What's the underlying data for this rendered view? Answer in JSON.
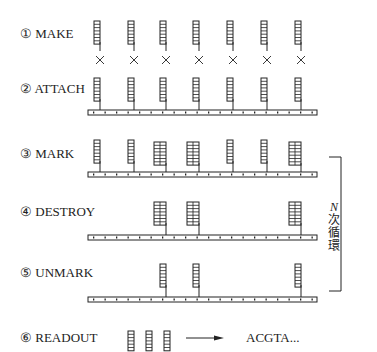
{
  "steps": [
    {
      "num": "①",
      "name": "MAKE",
      "label": "① MAKE"
    },
    {
      "num": "②",
      "name": "ATTACH",
      "label": "② ATTACH"
    },
    {
      "num": "③",
      "name": "MARK",
      "label": "③ MARK"
    },
    {
      "num": "④",
      "name": "DESTROY",
      "label": "④ DESTROY"
    },
    {
      "num": "⑤",
      "name": "UNMARK",
      "label": "⑤ UNMARK"
    },
    {
      "num": "⑥",
      "name": "READOUT",
      "label": "⑥ READOUT"
    }
  ],
  "loop": {
    "n": "N",
    "chars": [
      "次",
      "循",
      "環"
    ]
  },
  "readout": {
    "result": "ACGTA..."
  },
  "diagram": {
    "strand_columns_x": [
      100,
      134,
      166,
      199,
      233,
      267,
      301
    ],
    "make_row": {
      "strands": 7,
      "detached": true
    },
    "attach_row": {
      "strands": 7
    },
    "mark_row": {
      "single": [
        0,
        1,
        4,
        5
      ],
      "double": [
        2,
        3,
        6
      ]
    },
    "destroy_row": {
      "double": [
        2,
        3,
        6
      ]
    },
    "unmark_row": {
      "single": [
        2,
        3,
        6
      ]
    },
    "readout_row": {
      "strands": 3
    }
  },
  "colors": {
    "line": "#222222",
    "background": "#ffffff"
  }
}
